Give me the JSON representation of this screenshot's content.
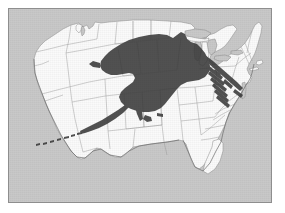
{
  "figure": {
    "kind": "map",
    "caption_partial": ""
  },
  "frame": {
    "border_color": "#8e8e8e",
    "left": 8,
    "top": 8,
    "width": 264,
    "height": 195
  },
  "colors": {
    "background_ocean": "#c9c9c9",
    "land_fill": "#fbfbfb",
    "state_border": "#989898",
    "coastline": "#6e6e6e",
    "alaska_overlay": "#3a3a3a",
    "page": "#ffffff"
  },
  "layers": [
    {
      "name": "contiguous-united-states",
      "fill": "#fbfbfb",
      "label": ""
    },
    {
      "name": "state-boundaries",
      "fill": "none",
      "label": ""
    },
    {
      "name": "alaska-overlay",
      "fill": "#3a3a3a",
      "label": ""
    },
    {
      "name": "aleutian-islands-overlay",
      "fill": "#3a3a3a",
      "label": ""
    }
  ],
  "map_features": {
    "water_bodies": [
      "Great Lakes",
      "Gulf of Mexico",
      "Atlantic Ocean",
      "Pacific Ocean",
      "Puget Sound",
      "Chesapeake Bay"
    ],
    "landmarks": [
      "Florida peninsula",
      "Michigan Lower Peninsula",
      "Upper Peninsula",
      "Cape Cod",
      "Maine",
      "Long Island",
      "Baja peninsula"
    ]
  },
  "overlay": {
    "name": "Alaska",
    "description": "Alaska silhouette scaled to the same map projection and centered over the central United States",
    "includes_aleutians": true,
    "extent_note": "spans from the northern plains southward, with the Aleutian chain trailing east"
  }
}
